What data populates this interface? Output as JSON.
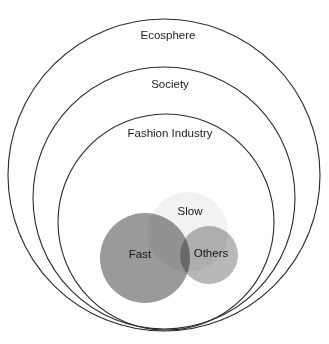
{
  "diagram": {
    "title_cropped": "",
    "background_color": "#ffffff",
    "outline_color": "#2b2b2b",
    "rings": [
      {
        "id": "ecosphere",
        "label": "Ecosphere",
        "label_x": 168,
        "label_y": 36,
        "cx": 164,
        "cy": 175,
        "r": 156
      },
      {
        "id": "society",
        "label": "Society",
        "label_x": 170,
        "label_y": 85,
        "cx": 164,
        "cy": 198,
        "r": 131
      },
      {
        "id": "fashion-industry",
        "label": "Fashion Industry",
        "label_x": 170,
        "label_y": 134,
        "cx": 166,
        "cy": 222,
        "r": 108
      }
    ],
    "blobs": [
      {
        "id": "slow",
        "label": "Slow",
        "color": "#f2f2f2",
        "label_color": "#141414",
        "cx": 188,
        "cy": 232,
        "r": 40,
        "label_x": 190,
        "label_y": 212
      },
      {
        "id": "fast",
        "label": "Fast",
        "color": "#9a9a9a",
        "label_color": "#141414",
        "cx": 145,
        "cy": 258,
        "r": 45,
        "label_x": 140,
        "label_y": 255
      },
      {
        "id": "others",
        "label": "Others",
        "color": "#b8b8b8",
        "label_color": "#141414",
        "cx": 209,
        "cy": 255,
        "r": 29,
        "label_x": 211,
        "label_y": 254
      }
    ]
  }
}
